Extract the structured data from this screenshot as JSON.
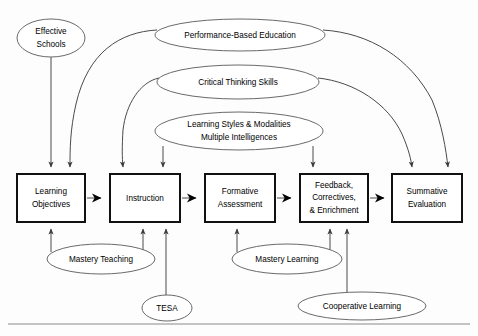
{
  "diagram": {
    "colors": {
      "box_stroke": "#111111",
      "ellipse_stroke": "#6a6a6a",
      "connector": "#4a4a4a",
      "background": "#fdfdfd",
      "text": "#000000"
    },
    "process_boxes": [
      {
        "id": "learning-objectives",
        "lines": [
          "Learning",
          "Objectives"
        ],
        "x": 17,
        "y": 174,
        "w": 68,
        "h": 48
      },
      {
        "id": "instruction",
        "lines": [
          "Instruction"
        ],
        "x": 110,
        "y": 174,
        "w": 70,
        "h": 48
      },
      {
        "id": "formative-assessment",
        "lines": [
          "Formative",
          "Assessment"
        ],
        "x": 205,
        "y": 174,
        "w": 70,
        "h": 48
      },
      {
        "id": "feedback-correctives-enrichment",
        "lines": [
          "Feedback,",
          "Correctives,",
          "& Enrichment"
        ],
        "x": 300,
        "y": 174,
        "w": 68,
        "h": 48
      },
      {
        "id": "summative-evaluation",
        "lines": [
          "Summative",
          "Evaluation"
        ],
        "x": 392,
        "y": 174,
        "w": 70,
        "h": 48
      }
    ],
    "ellipses": [
      {
        "id": "effective-schools",
        "lines": [
          "Effective",
          "Schools"
        ],
        "cx": 51,
        "cy": 38,
        "rx": 34,
        "ry": 19
      },
      {
        "id": "performance-based-education",
        "lines": [
          "Performance-Based Education"
        ],
        "cx": 240,
        "cy": 35,
        "rx": 85,
        "ry": 16
      },
      {
        "id": "critical-thinking-skills",
        "lines": [
          "Critical Thinking Skills"
        ],
        "cx": 238,
        "cy": 82,
        "rx": 81,
        "ry": 17
      },
      {
        "id": "learning-styles-multiple-intelligences",
        "lines": [
          "Learning Styles & Modalities",
          "Multiple Intelligences"
        ],
        "cx": 239,
        "cy": 131,
        "rx": 84,
        "ry": 19
      },
      {
        "id": "mastery-teaching",
        "lines": [
          "Mastery Teaching"
        ],
        "cx": 101,
        "cy": 259,
        "rx": 54,
        "ry": 15
      },
      {
        "id": "mastery-learning",
        "lines": [
          "Mastery Learning"
        ],
        "cx": 287,
        "cy": 259,
        "rx": 55,
        "ry": 15
      },
      {
        "id": "tesa",
        "lines": [
          "TESA"
        ],
        "cx": 167,
        "cy": 308,
        "rx": 25,
        "ry": 13
      },
      {
        "id": "cooperative-learning",
        "lines": [
          "Cooperative Learning"
        ],
        "cx": 362,
        "cy": 306,
        "rx": 64,
        "ry": 14
      }
    ],
    "flow_arrows": [
      {
        "from": "learning-objectives",
        "to": "instruction"
      },
      {
        "from": "instruction",
        "to": "formative-assessment"
      },
      {
        "from": "formative-assessment",
        "to": "feedback-correctives-enrichment"
      },
      {
        "from": "feedback-correctives-enrichment",
        "to": "summative-evaluation"
      }
    ],
    "connections": [
      {
        "from": "effective-schools",
        "to": "learning-objectives"
      },
      {
        "from": "performance-based-education",
        "to": "learning-objectives"
      },
      {
        "from": "performance-based-education",
        "to": "summative-evaluation"
      },
      {
        "from": "critical-thinking-skills",
        "to": "instruction"
      },
      {
        "from": "critical-thinking-skills",
        "to": "summative-evaluation"
      },
      {
        "from": "learning-styles-multiple-intelligences",
        "to": "instruction"
      },
      {
        "from": "learning-styles-multiple-intelligences",
        "to": "feedback-correctives-enrichment"
      },
      {
        "from": "mastery-teaching",
        "to": "learning-objectives"
      },
      {
        "from": "mastery-teaching",
        "to": "instruction"
      },
      {
        "from": "tesa",
        "to": "instruction"
      },
      {
        "from": "mastery-learning",
        "to": "formative-assessment"
      },
      {
        "from": "mastery-learning",
        "to": "feedback-correctives-enrichment"
      },
      {
        "from": "cooperative-learning",
        "to": "feedback-correctives-enrichment"
      }
    ]
  }
}
